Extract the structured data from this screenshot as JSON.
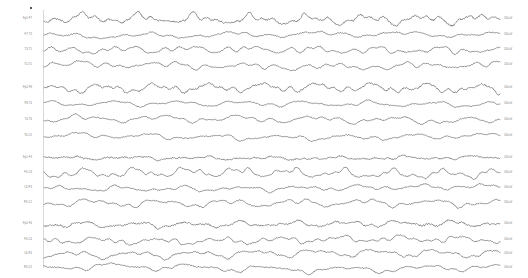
{
  "recording": {
    "title": "EEG recording",
    "montage": "bipolar longitudinal",
    "background_color": "#ffffff",
    "trace_color": "#1a1a1a",
    "label_color": "#777777",
    "marker_color": "#5a5a5a",
    "onset_line_color": "#d8d8d8",
    "channel_count": 16,
    "block_count": 4
  },
  "markers": {
    "event_marker_name": "event-marker",
    "onset_line_name": "onset-marker-line"
  },
  "chart_data": {
    "type": "line",
    "xlabel": "",
    "ylabel": "",
    "grid": false,
    "legend": "none",
    "x_range": [
      0,
      456
    ],
    "blocks": [
      {
        "name": "block-1",
        "top": 10,
        "channels": [
          {
            "label": "Fp1-F7",
            "scale": "100 uV",
            "row_top": 11,
            "amplitude": 3.6,
            "noise": 0.95,
            "freq": 1.55,
            "seed": 11,
            "drift": 0.5
          },
          {
            "label": "F7-T3",
            "scale": "100 uV",
            "row_top": 27,
            "amplitude": 2.0,
            "noise": 0.55,
            "freq": 1.15,
            "seed": 23,
            "drift": 0.4
          },
          {
            "label": "T3-T5",
            "scale": "100 uV",
            "row_top": 42,
            "amplitude": 3.0,
            "noise": 0.6,
            "freq": 1.35,
            "seed": 37,
            "drift": 0.6
          },
          {
            "label": "T5-O1",
            "scale": "100 uV",
            "row_top": 57,
            "amplitude": 2.8,
            "noise": 0.55,
            "freq": 1.2,
            "seed": 53,
            "drift": 0.7
          }
        ]
      },
      {
        "name": "block-2",
        "top": 80,
        "channels": [
          {
            "label": "Fp2-F8",
            "scale": "100 uV",
            "row_top": 80,
            "amplitude": 3.4,
            "noise": 0.9,
            "freq": 1.5,
            "seed": 71,
            "drift": 0.5
          },
          {
            "label": "F8-T4",
            "scale": "100 uV",
            "row_top": 96,
            "amplitude": 1.9,
            "noise": 0.5,
            "freq": 1.1,
            "seed": 89,
            "drift": 0.4
          },
          {
            "label": "T4-T6",
            "scale": "100 uV",
            "row_top": 112,
            "amplitude": 2.6,
            "noise": 0.55,
            "freq": 1.25,
            "seed": 101,
            "drift": 0.55
          },
          {
            "label": "T6-O2",
            "scale": "100 uV",
            "row_top": 128,
            "amplitude": 2.2,
            "noise": 0.5,
            "freq": 1.15,
            "seed": 113,
            "drift": 0.5
          }
        ]
      },
      {
        "name": "block-3",
        "top": 150,
        "channels": [
          {
            "label": "Fp1-F3",
            "scale": "100 uV",
            "row_top": 150,
            "amplitude": 1.5,
            "noise": 0.75,
            "freq": 1.4,
            "seed": 131,
            "drift": 0.35
          },
          {
            "label": "F3-C3",
            "scale": "100 uV",
            "row_top": 165,
            "amplitude": 3.1,
            "noise": 0.6,
            "freq": 1.75,
            "seed": 149,
            "drift": 0.5
          },
          {
            "label": "C3-P3",
            "scale": "100 uV",
            "row_top": 180,
            "amplitude": 2.3,
            "noise": 0.55,
            "freq": 1.2,
            "seed": 167,
            "drift": 0.5
          },
          {
            "label": "P3-O1",
            "scale": "100 uV",
            "row_top": 195,
            "amplitude": 2.5,
            "noise": 0.6,
            "freq": 1.3,
            "seed": 181,
            "drift": 0.55
          }
        ]
      },
      {
        "name": "block-4",
        "top": 216,
        "channels": [
          {
            "label": "Fp2-F4",
            "scale": "100 uV",
            "row_top": 216,
            "amplitude": 2.2,
            "noise": 0.85,
            "freq": 1.45,
            "seed": 199,
            "drift": 0.45
          },
          {
            "label": "F4-C4",
            "scale": "100 uV",
            "row_top": 232,
            "amplitude": 2.6,
            "noise": 0.6,
            "freq": 1.6,
            "seed": 211,
            "drift": 0.5
          },
          {
            "label": "C4-P4",
            "scale": "100 uV",
            "row_top": 246,
            "amplitude": 2.5,
            "noise": 0.65,
            "freq": 1.35,
            "seed": 227,
            "drift": 0.5
          },
          {
            "label": "P4-O2",
            "scale": "100 uV",
            "row_top": 260,
            "amplitude": 2.3,
            "noise": 0.6,
            "freq": 1.25,
            "seed": 241,
            "drift": 0.5
          }
        ]
      }
    ]
  }
}
